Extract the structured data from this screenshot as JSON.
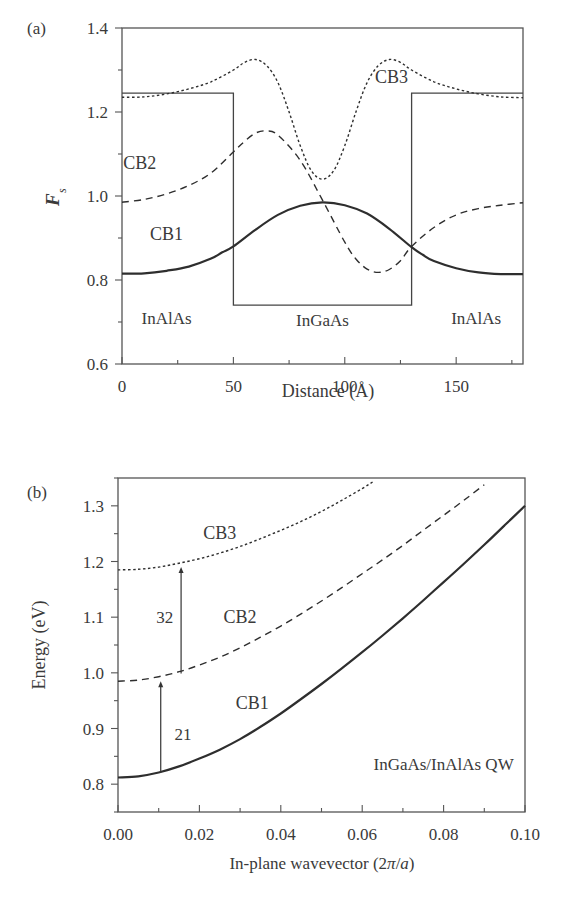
{
  "chart_data": [
    {
      "type": "line",
      "panel_label": "(a)",
      "title": "",
      "xlabel": "Distance (Å)",
      "ylabel": "F_s",
      "ylabel_main": "F",
      "ylabel_sub": "s",
      "xlim": [
        0,
        180
      ],
      "ylim": [
        0.6,
        1.4
      ],
      "xticks": [
        0,
        50,
        100,
        150
      ],
      "yticks": [
        0.6,
        0.8,
        1.0,
        1.2,
        1.4
      ],
      "ytick_labels": [
        "0.6",
        "0.8",
        "1.0",
        "1.2",
        "1.4"
      ],
      "grid": false,
      "region_labels": [
        {
          "text": "InAlAs",
          "x": 20,
          "y": 0.695
        },
        {
          "text": "InGaAs",
          "x": 90,
          "y": 0.69
        },
        {
          "text": "InAlAs",
          "x": 159,
          "y": 0.695
        }
      ],
      "band_profile": {
        "x": [
          0,
          50,
          50,
          130,
          130,
          180
        ],
        "y": [
          1.245,
          1.245,
          0.74,
          0.74,
          1.245,
          1.245
        ]
      },
      "series": [
        {
          "name": "CB1",
          "style": "solid",
          "label_pos": {
            "x": 20,
            "y": 0.895
          },
          "x": [
            0,
            10,
            20,
            30,
            40,
            45,
            50,
            60,
            70,
            80,
            90,
            100,
            110,
            120,
            130,
            135,
            140,
            150,
            160,
            170,
            180
          ],
          "y": [
            0.815,
            0.816,
            0.822,
            0.832,
            0.851,
            0.866,
            0.88,
            0.92,
            0.955,
            0.977,
            0.985,
            0.978,
            0.958,
            0.922,
            0.878,
            0.86,
            0.845,
            0.828,
            0.818,
            0.814,
            0.814
          ]
        },
        {
          "name": "CB2",
          "style": "dashed",
          "label_pos": {
            "x": 8,
            "y": 1.065
          },
          "x": [
            0,
            10,
            20,
            30,
            40,
            50,
            55,
            60,
            65,
            70,
            80,
            90,
            100,
            105,
            110,
            115,
            120,
            125,
            130,
            140,
            150,
            160,
            170,
            180
          ],
          "y": [
            0.985,
            0.992,
            1.005,
            1.025,
            1.055,
            1.105,
            1.13,
            1.15,
            1.155,
            1.145,
            1.085,
            0.99,
            0.89,
            0.85,
            0.826,
            0.818,
            0.825,
            0.846,
            0.88,
            0.925,
            0.955,
            0.97,
            0.978,
            0.984
          ]
        },
        {
          "name": "CB3",
          "style": "dotted",
          "label_pos": {
            "x": 121,
            "y": 1.27
          },
          "x": [
            0,
            10,
            20,
            30,
            40,
            50,
            55,
            60,
            65,
            70,
            75,
            80,
            85,
            90,
            95,
            100,
            105,
            110,
            115,
            120,
            125,
            130,
            140,
            150,
            160,
            170,
            180
          ],
          "y": [
            1.235,
            1.236,
            1.243,
            1.255,
            1.272,
            1.3,
            1.318,
            1.325,
            1.31,
            1.27,
            1.2,
            1.12,
            1.06,
            1.04,
            1.06,
            1.12,
            1.2,
            1.27,
            1.31,
            1.325,
            1.318,
            1.3,
            1.272,
            1.255,
            1.243,
            1.236,
            1.234
          ]
        }
      ]
    },
    {
      "type": "line",
      "panel_label": "(b)",
      "title": "",
      "xlabel": "In-plane wavevector (2π/a)",
      "xlabel_parts": {
        "prefix": "In-plane wavevector (2",
        "pi": "π",
        "slash": "/",
        "a": "a",
        "suffix": ")"
      },
      "ylabel": "Energy (eV)",
      "xlim": [
        0,
        0.1
      ],
      "ylim": [
        0.75,
        1.35
      ],
      "xticks": [
        0.0,
        0.02,
        0.04,
        0.06,
        0.08,
        0.1
      ],
      "xtick_labels": [
        "0.00",
        "0.02",
        "0.04",
        "0.06",
        "0.08",
        "0.10"
      ],
      "yticks": [
        0.8,
        0.9,
        1.0,
        1.1,
        1.2,
        1.3
      ],
      "ytick_labels": [
        "0.8",
        "0.9",
        "1.0",
        "1.1",
        "1.2",
        "1.3"
      ],
      "grid": false,
      "annotation": {
        "text": "InGaAs/InAlAs QW",
        "x": 0.08,
        "y": 0.825
      },
      "arrows": [
        {
          "label": "21",
          "x": 0.0105,
          "y_from": 0.821,
          "y_to": 0.985,
          "label_x": 0.016,
          "label_y": 0.89
        },
        {
          "label": "32",
          "x": 0.0155,
          "y_from": 0.999,
          "y_to": 1.19,
          "label_x": 0.0115,
          "label_y": 1.1
        }
      ],
      "series": [
        {
          "name": "CB1",
          "style": "solid",
          "label_pos": {
            "x": 0.033,
            "y": 0.935
          },
          "x": [
            0,
            0.005,
            0.01,
            0.015,
            0.02,
            0.025,
            0.03,
            0.035,
            0.04,
            0.045,
            0.05,
            0.055,
            0.06,
            0.065,
            0.07,
            0.075,
            0.08,
            0.085,
            0.09,
            0.095,
            0.1
          ],
          "y": [
            0.812,
            0.814,
            0.821,
            0.832,
            0.846,
            0.862,
            0.881,
            0.903,
            0.927,
            0.953,
            0.98,
            1.008,
            1.037,
            1.067,
            1.098,
            1.13,
            1.163,
            1.196,
            1.23,
            1.265,
            1.3
          ]
        },
        {
          "name": "CB2",
          "style": "dashed",
          "label_pos": {
            "x": 0.03,
            "y": 1.09
          },
          "x": [
            0,
            0.005,
            0.01,
            0.015,
            0.02,
            0.025,
            0.03,
            0.035,
            0.04,
            0.045,
            0.05,
            0.055,
            0.06,
            0.065,
            0.07,
            0.075,
            0.08,
            0.085,
            0.09
          ],
          "y": [
            0.985,
            0.987,
            0.993,
            1.002,
            1.014,
            1.028,
            1.045,
            1.064,
            1.084,
            1.106,
            1.129,
            1.153,
            1.178,
            1.203,
            1.229,
            1.256,
            1.283,
            1.31,
            1.338
          ]
        },
        {
          "name": "CB3",
          "style": "dotted",
          "label_pos": {
            "x": 0.025,
            "y": 1.24
          },
          "x": [
            0,
            0.005,
            0.01,
            0.015,
            0.02,
            0.025,
            0.03,
            0.035,
            0.04,
            0.045,
            0.05,
            0.055,
            0.06,
            0.063
          ],
          "y": [
            1.185,
            1.186,
            1.19,
            1.197,
            1.205,
            1.215,
            1.227,
            1.241,
            1.256,
            1.272,
            1.29,
            1.31,
            1.331,
            1.345
          ]
        }
      ]
    }
  ]
}
